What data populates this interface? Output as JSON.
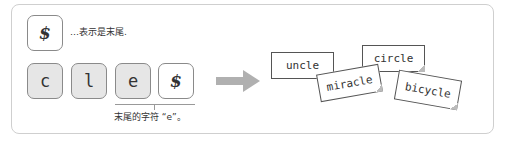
{
  "legend": {
    "symbol": "$",
    "text": "…表示是末尾."
  },
  "keys": [
    {
      "char": "c",
      "style": "gray"
    },
    {
      "char": "l",
      "style": "gray"
    },
    {
      "char": "e",
      "style": "gray"
    },
    {
      "char": "$",
      "style": "white"
    }
  ],
  "caption": "末尾的字符 “e”。",
  "cards": [
    {
      "word": "uncle"
    },
    {
      "word": "circle"
    },
    {
      "word": "miracle"
    },
    {
      "word": "bicycle"
    }
  ],
  "colors": {
    "key_fill": "#e6e6e6",
    "arrow": "#b0b0b0",
    "border": "#8a8a8a"
  }
}
